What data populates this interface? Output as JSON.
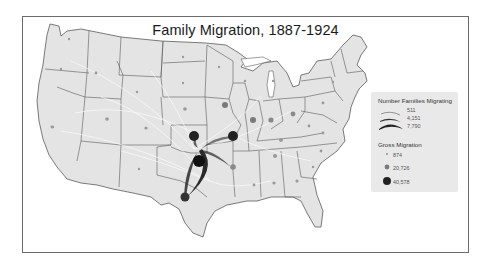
{
  "title": "Family Migration, 1887-1924",
  "legend": {
    "flow_title": "Number Families Migrating",
    "flow_values": [
      "511",
      "4,151",
      "7,790"
    ],
    "gross_title": "Gross Migration",
    "gross_values": [
      "874",
      "20,726",
      "40,578"
    ]
  },
  "colors": {
    "land": "#e4e4e4",
    "border": "#5a5a5a",
    "dot_small": "#9a9a9a",
    "dot_medium": "#7a7a7a",
    "dot_large": "#222222",
    "flow": "#2a2a2a"
  },
  "map": {
    "region": "Contiguous United States",
    "large_nodes": [
      "Kansas",
      "Missouri",
      "Oklahoma",
      "Texas"
    ],
    "medium_nodes": [
      "Iowa",
      "Illinois",
      "Indiana",
      "Arkansas",
      "Ohio"
    ]
  }
}
